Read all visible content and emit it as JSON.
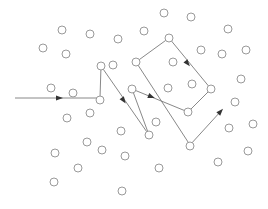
{
  "diagram": {
    "type": "path-through-scattered-points",
    "width": 268,
    "height": 209,
    "node_radius": 4,
    "colors": {
      "background": "#ffffff",
      "node_stroke": "#9a9a9a",
      "edge": "#7a7a7a",
      "arrowhead": "#333333"
    },
    "nodes": [
      [
        164,
        13
      ],
      [
        191,
        17
      ],
      [
        144,
        31
      ],
      [
        228,
        29
      ],
      [
        62,
        30
      ],
      [
        90,
        34
      ],
      [
        118,
        39
      ],
      [
        169,
        38
      ],
      [
        43,
        48
      ],
      [
        66,
        54
      ],
      [
        201,
        50
      ],
      [
        222,
        54
      ],
      [
        246,
        50
      ],
      [
        101,
        66
      ],
      [
        113,
        65
      ],
      [
        136,
        62
      ],
      [
        173,
        62
      ],
      [
        241,
        79
      ],
      [
        51,
        88
      ],
      [
        73,
        93
      ],
      [
        132,
        89
      ],
      [
        168,
        88
      ],
      [
        192,
        84
      ],
      [
        211,
        89
      ],
      [
        100,
        100
      ],
      [
        235,
        102
      ],
      [
        90,
        113
      ],
      [
        67,
        118
      ],
      [
        188,
        112
      ],
      [
        156,
        122
      ],
      [
        229,
        128
      ],
      [
        253,
        124
      ],
      [
        121,
        131
      ],
      [
        149,
        135
      ],
      [
        87,
        142
      ],
      [
        102,
        150
      ],
      [
        190,
        146
      ],
      [
        55,
        153
      ],
      [
        125,
        156
      ],
      [
        248,
        151
      ],
      [
        218,
        162
      ],
      [
        78,
        168
      ],
      [
        159,
        168
      ],
      [
        54,
        182
      ],
      [
        122,
        191
      ]
    ],
    "path": [
      [
        15,
        98
      ],
      [
        100,
        98
      ],
      [
        101,
        66
      ],
      [
        149,
        135
      ],
      [
        132,
        89
      ],
      [
        188,
        112
      ],
      [
        211,
        89
      ],
      [
        169,
        38
      ],
      [
        136,
        62
      ],
      [
        190,
        145
      ],
      [
        221,
        111
      ]
    ],
    "arrowheads": [
      {
        "x": 60,
        "y": 98,
        "angle": 0
      },
      {
        "x": 124,
        "y": 101,
        "angle": 55
      },
      {
        "x": 152,
        "y": 97,
        "angle": 22
      },
      {
        "x": 188,
        "y": 64,
        "angle": 51
      },
      {
        "x": 221,
        "y": 111,
        "angle": -47
      }
    ]
  }
}
